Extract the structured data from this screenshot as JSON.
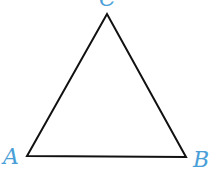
{
  "diagram": {
    "type": "triangle",
    "stroke_color": "#111111",
    "label_color": "#4a9fd8",
    "vertices": [
      {
        "name": "A",
        "x": 27,
        "y": 156
      },
      {
        "name": "B",
        "x": 186,
        "y": 157
      },
      {
        "name": "C",
        "x": 107,
        "y": 14
      }
    ],
    "labels": {
      "A": "A",
      "B": "B",
      "C": "C"
    }
  }
}
